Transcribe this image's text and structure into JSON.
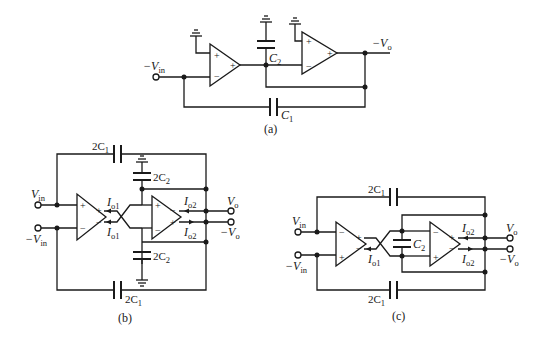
{
  "figure": {
    "panels": [
      {
        "id": "a",
        "caption": "(a)",
        "labels": {
          "input": "−V",
          "input_sub": "in",
          "output": "−V",
          "output_sub": "o",
          "c1": "C",
          "c1_sub": "1",
          "c2": "C",
          "c2_sub": "2"
        },
        "opamps": [
          {
            "name": "opamp-1",
            "plus_in": "+",
            "minus_in": "−",
            "out": "+"
          },
          {
            "name": "opamp-2",
            "plus_in": "+",
            "minus_in": "−",
            "out": "+"
          }
        ]
      },
      {
        "id": "b",
        "caption": "(b)",
        "labels": {
          "vin": "V",
          "vin_sub": "in",
          "neg_vin": "−V",
          "neg_vin_sub": "in",
          "vo": "V",
          "vo_sub": "o",
          "neg_vo": "−V",
          "neg_vo_sub": "o",
          "io1_top": "I",
          "io1_top_sub": "o1",
          "io1_bot": "I",
          "io1_bot_sub": "o1",
          "io2_top": "I",
          "io2_top_sub": "o2",
          "io2_bot": "I",
          "io2_bot_sub": "o2",
          "c1_top": "2C",
          "c1_top_sub": "1",
          "c1_bot": "2C",
          "c1_bot_sub": "1",
          "c2_top": "2C",
          "c2_top_sub": "2",
          "c2_bot": "2C",
          "c2_bot_sub": "2"
        },
        "opamps": [
          {
            "name": "ota-1",
            "in_top": "+",
            "in_bot": "−",
            "out_top": "+",
            "out_bot": "−"
          },
          {
            "name": "ota-2",
            "in_top": "+",
            "in_bot": "−",
            "out_top": "−",
            "out_bot": "+"
          }
        ]
      },
      {
        "id": "c",
        "caption": "(c)",
        "labels": {
          "vin": "V",
          "vin_sub": "in",
          "neg_vin": "−V",
          "neg_vin_sub": "in",
          "vo": "V",
          "vo_sub": "o",
          "neg_vo": "−V",
          "neg_vo_sub": "o",
          "io1": "I",
          "io1_sub": "o1",
          "io2_top": "I",
          "io2_top_sub": "o2",
          "io2_bot": "I",
          "io2_bot_sub": "o2",
          "c1_top": "2C",
          "c1_top_sub": "1",
          "c1_bot": "2C",
          "c1_bot_sub": "1",
          "c2": "C",
          "c2_sub": "2"
        },
        "opamps": [
          {
            "name": "ota-1",
            "in_top": "−",
            "in_bot": "+",
            "out_top": "+",
            "out_bot": "−"
          },
          {
            "name": "ota-2",
            "in_top": "−",
            "in_bot": "+",
            "out_top": "+",
            "out_bot": "−"
          }
        ]
      }
    ]
  }
}
